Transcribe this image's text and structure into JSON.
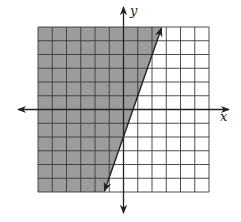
{
  "chart_data": {
    "type": "inequality-graph",
    "title": "",
    "xlabel": "x",
    "ylabel": "y",
    "xlim": [
      -6,
      6
    ],
    "ylim": [
      -6,
      6
    ],
    "grid": true,
    "grid_step": 1,
    "tick_labels": "none",
    "boundary_line": {
      "equation": "y = 3x - 2",
      "slope": 3,
      "intercept": -2,
      "style": "solid",
      "arrows": "both",
      "points": [
        [
          -1.333,
          -6
        ],
        [
          2.667,
          6
        ]
      ]
    },
    "shaded_region": {
      "side": "left/above",
      "inequality": "y >= 3x - 2"
    }
  },
  "colors": {
    "shade": "#9c9c9c",
    "grid": "#3a3a3a",
    "axis": "#222222",
    "line": "#222222",
    "background": "#ffffff"
  },
  "labels": {
    "x_axis": "x",
    "y_axis": "y"
  }
}
